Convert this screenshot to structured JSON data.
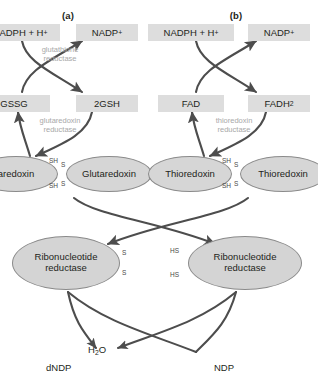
{
  "figure": {
    "panels": [
      {
        "id": "a",
        "label": "(a)",
        "pathway": "glutaredoxin system",
        "cofactor_in": "NADPH + H",
        "cofactor_in_charge": "+",
        "cofactor_out": "NADP",
        "cofactor_out_charge": "+",
        "carrier_oxidized": "GSSG",
        "carrier_reduced": "2GSH",
        "enzyme_top": "glutathione\nreductase",
        "enzyme_top_line1": "glutathione",
        "enzyme_top_line2": "reductase",
        "enzyme_bottom_line1": "glutaredoxin",
        "enzyme_bottom_line2": "reductase",
        "protein_reduced": "aredoxin",
        "protein_oxidized": "Glutaredoxin"
      },
      {
        "id": "b",
        "label": "(b)",
        "pathway": "thioredoxin system",
        "cofactor_in": "NADPH + H",
        "cofactor_in_charge": "+",
        "cofactor_out": "NADP",
        "cofactor_out_charge": "+",
        "carrier_oxidized": "FAD",
        "carrier_reduced": "FADH",
        "carrier_reduced_sub": "2",
        "enzyme_bottom_line1": "thioredoxin",
        "enzyme_bottom_line2": "reductase",
        "protein_reduced": "Thioredoxin",
        "protein_oxidized": "Thioredoxin"
      }
    ],
    "enzyme_center": {
      "line1": "Ribonucleotide",
      "line2": "reductase"
    },
    "thiol_labels": {
      "sh": "SH",
      "hs": "HS",
      "s": "S"
    },
    "products": {
      "deoxy_product": "dNDP",
      "water": "H",
      "water_sub": "2",
      "water_suffix": "O",
      "substrate": "NDP"
    },
    "colors": {
      "box_fill": "#dddddd",
      "ellipse_fill": "#d6d6d6",
      "ellipse_stroke": "#8a8a8a",
      "arrow": "#4d4d4d",
      "enzyme_text": "#a8a8a8",
      "text": "#231f20",
      "background": "#ffffff"
    }
  }
}
